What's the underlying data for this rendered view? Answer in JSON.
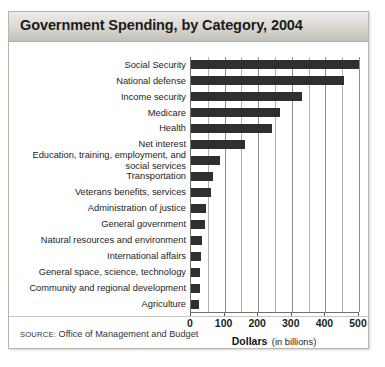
{
  "figure": {
    "title": "Government Spending, by Category, 2004",
    "source_label": "SOURCE:",
    "source_text": "Office of Management and Budget"
  },
  "axis": {
    "title_main": "Dollars",
    "title_sub": "(in billions)",
    "ticks": [
      "0",
      "100",
      "200",
      "300",
      "400",
      "500"
    ]
  },
  "colors": {
    "bar": "#2f2f2f",
    "grid": "#b0b0b0",
    "axis": "#6f6f6f",
    "title_bar_top": "#ececea",
    "title_bar_bottom": "#c4c1ba"
  },
  "chart_data": {
    "type": "bar",
    "orientation": "horizontal",
    "title": "Government Spending, by Category, 2004",
    "xlabel": "Dollars (in billions)",
    "ylabel": "",
    "xlim": [
      0,
      500
    ],
    "xticks": [
      0,
      100,
      200,
      300,
      400,
      500
    ],
    "grid": true,
    "gridline_interval": 50,
    "legend": null,
    "units": "billions of dollars",
    "categories": [
      "Social Security",
      "National defense",
      "Income security",
      "Medicare",
      "Health",
      "Net interest",
      "Education, training, employment, and social services",
      "Transportation",
      "Veterans benefits, services",
      "Administration of justice",
      "General government",
      "Natural resources and environment",
      "International affairs",
      "General space, science, technology",
      "Community and regional development",
      "Agriculture"
    ],
    "values": [
      500,
      455,
      330,
      265,
      240,
      160,
      85,
      65,
      60,
      45,
      43,
      32,
      30,
      28,
      27,
      25
    ]
  },
  "labels": [
    {
      "text": "Social Security",
      "two_line": false
    },
    {
      "text": "National defense",
      "two_line": false
    },
    {
      "text": "Income security",
      "two_line": false
    },
    {
      "text": "Medicare",
      "two_line": false
    },
    {
      "text": "Health",
      "two_line": false
    },
    {
      "text": "Net interest",
      "two_line": false
    },
    {
      "text": "Education, training, employment, and social services",
      "two_line": true
    },
    {
      "text": "Transportation",
      "two_line": false
    },
    {
      "text": "Veterans benefits, services",
      "two_line": false
    },
    {
      "text": "Administration of justice",
      "two_line": false
    },
    {
      "text": "General government",
      "two_line": false
    },
    {
      "text": "Natural resources and environment",
      "two_line": false
    },
    {
      "text": "International affairs",
      "two_line": false
    },
    {
      "text": "General space, science, technology",
      "two_line": false
    },
    {
      "text": "Community and regional development",
      "two_line": false
    },
    {
      "text": "Agriculture",
      "two_line": false
    }
  ]
}
